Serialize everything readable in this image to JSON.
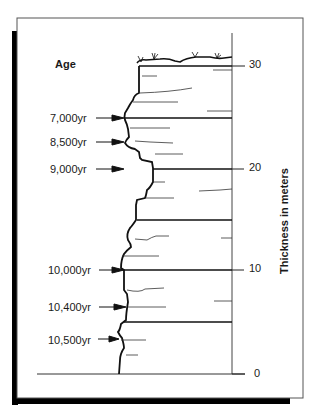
{
  "figure": {
    "age_heading": "Age",
    "axis_label": "Thickness in meters",
    "colors": {
      "ink": "#1a1a1a",
      "frame": "#555555",
      "shadow": "#000000",
      "background": "#ffffff"
    }
  },
  "scale": {
    "ticks": [
      {
        "label": "30",
        "value": 30
      },
      {
        "label": "20",
        "value": 20
      },
      {
        "label": "10",
        "value": 10
      },
      {
        "label": "0",
        "value": 0
      }
    ]
  },
  "ages": [
    {
      "label": "7,000yr"
    },
    {
      "label": "8,500yr"
    },
    {
      "label": "9,000yr"
    },
    {
      "label": "10,000yr"
    },
    {
      "label": "10,400yr"
    },
    {
      "label": "10,500yr"
    }
  ]
}
